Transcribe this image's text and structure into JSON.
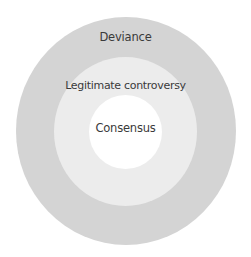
{
  "diagram": {
    "type": "concentric-spheres",
    "colors": {
      "outer": "#d4d4d4",
      "middle": "#ececec",
      "inner": "#ffffff",
      "text": "#3a3a3a"
    },
    "spheres": [
      {
        "label": "Deviance",
        "level": "outer"
      },
      {
        "label": "Legitimate controversy",
        "level": "middle"
      },
      {
        "label": "Consensus",
        "level": "inner"
      }
    ]
  }
}
